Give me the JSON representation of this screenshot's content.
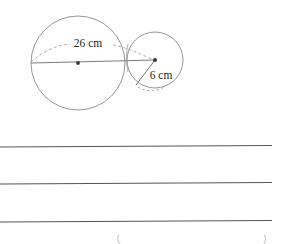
{
  "document": {
    "type": "geometry-worksheet-figure",
    "background_color": "#ffffff"
  },
  "figure": {
    "name": "two-tangent-circles-diagram",
    "stroke_color": "#8a8a8a",
    "line_color": "#6e6e6e",
    "dot_color": "#3a3a3a",
    "text_color": "#1d1d1d",
    "large_circle": {
      "label": "26 cm",
      "label_x": 88,
      "label_y": 47,
      "center_x": 78,
      "center_y": 63,
      "radius": 47,
      "measure_kind": "diameter"
    },
    "small_circle": {
      "label": "6 cm",
      "label_x": 161,
      "label_y": 79,
      "center_x": 155,
      "center_y": 60,
      "radius": 28,
      "measure_kind": "radius"
    },
    "diameter_line": {
      "x1": 31,
      "y1": 63,
      "x2": 155,
      "y2": 60
    },
    "radius_line": {
      "x1": 155,
      "y1": 60,
      "x2": 136,
      "y2": 85
    }
  },
  "answer_lines": {
    "name": "ruled-answer-lines",
    "color": "#555555",
    "left_x": 0,
    "right_x": 272,
    "rows": [
      17,
      54,
      92
    ]
  },
  "bottom_marks": {
    "name": "cropped-glyph-marks",
    "color": "#c9c9c9",
    "items": [
      {
        "x": 118,
        "y": 232,
        "glyph": "("
      },
      {
        "x": 265,
        "y": 232,
        "glyph": ")"
      }
    ]
  }
}
